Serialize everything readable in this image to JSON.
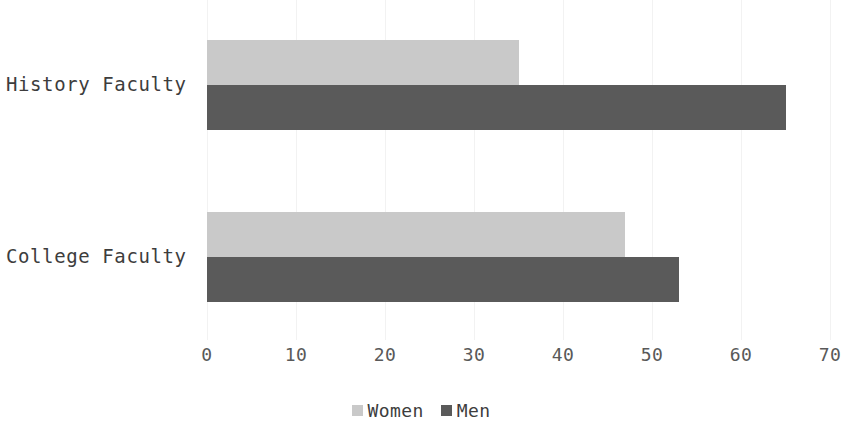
{
  "chart_data": {
    "type": "bar",
    "orientation": "horizontal",
    "title": "",
    "subtitle": "",
    "xlabel": "",
    "ylabel": "",
    "categories": [
      "History Faculty",
      "College Faculty"
    ],
    "series": [
      {
        "name": "Women",
        "color": "#c9c9c9",
        "values": [
          35,
          47
        ]
      },
      {
        "name": "Men",
        "color": "#5a5a5a",
        "values": [
          65,
          53
        ]
      }
    ],
    "xlim": [
      0,
      70
    ],
    "xticks": [
      0,
      10,
      20,
      30,
      40,
      50,
      60,
      70
    ],
    "xtick_labels": [
      "0",
      "10",
      "20",
      "30",
      "40",
      "50",
      "60",
      "70"
    ],
    "grid": {
      "vertical": true,
      "horizontal": false,
      "color": "#f2f2f2"
    },
    "legend": {
      "position": "bottom-center",
      "entries": [
        {
          "label": "Women",
          "color": "#c9c9c9"
        },
        {
          "label": "Men",
          "color": "#5a5a5a"
        }
      ]
    },
    "annotations": [],
    "background_color": "#ffffff",
    "text_color": "#3d3d3d",
    "tick_color": "#595959"
  },
  "axis": {
    "ticks": [
      {
        "value": "0"
      },
      {
        "value": "10"
      },
      {
        "value": "20"
      },
      {
        "value": "30"
      },
      {
        "value": "40"
      },
      {
        "value": "50"
      },
      {
        "value": "60"
      },
      {
        "value": "70"
      }
    ]
  },
  "categories": [
    {
      "label": "History Faculty"
    },
    {
      "label": "College Faculty"
    }
  ],
  "legend": {
    "items": [
      {
        "label": "Women"
      },
      {
        "label": "Men"
      }
    ]
  }
}
